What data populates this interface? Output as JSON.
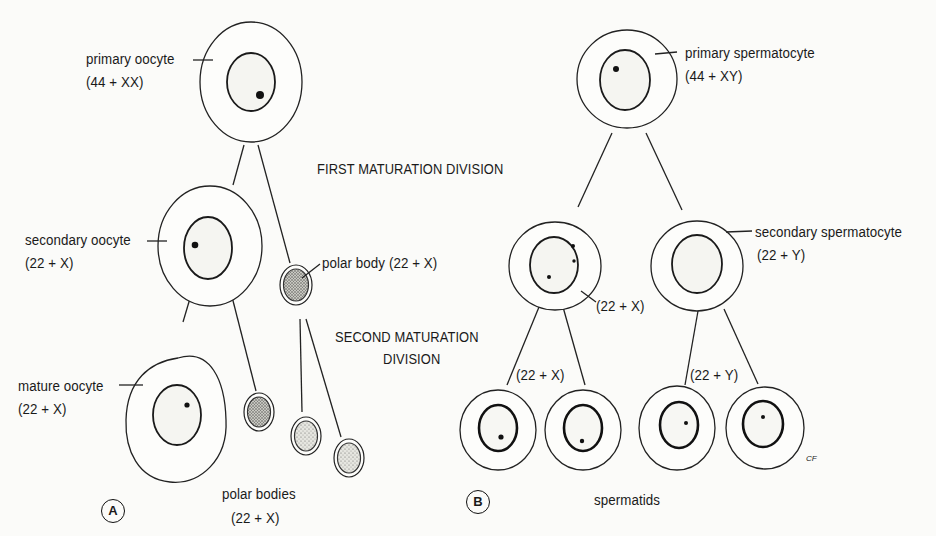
{
  "figure": {
    "panel_a": {
      "marker": "A",
      "cells": {
        "primary_oocyte": {
          "name": "primary oocyte",
          "karyotype": "(44 + XX)"
        },
        "secondary_oocyte": {
          "name": "secondary oocyte",
          "karyotype": "(22 + X)"
        },
        "first_polar_body": {
          "name": "polar body (22 + X)"
        },
        "mature_oocyte": {
          "name": "mature oocyte",
          "karyotype": "(22 + X)"
        },
        "polar_bodies": {
          "name": "polar bodies",
          "karyotype": "(22 + X)"
        }
      }
    },
    "stages": {
      "first": "FIRST MATURATION DIVISION",
      "second_line1": "SECOND MATURATION",
      "second_line2": "DIVISION"
    },
    "panel_b": {
      "marker": "B",
      "cells": {
        "primary_spermatocyte": {
          "name": "primary spermatocyte",
          "karyotype": "(44 + XY)"
        },
        "secondary_spermatocyte": {
          "name": "secondary spermatocyte",
          "karyotype": "(22 + Y)"
        },
        "secondary_spermatocyte_x": {
          "karyotype": "(22 + X)"
        },
        "spermatids_x": {
          "karyotype": "(22 + X)"
        },
        "spermatids_y": {
          "karyotype": "(22 + Y)"
        },
        "spermatids": {
          "name": "spermatids"
        }
      }
    },
    "signature": "CF"
  }
}
